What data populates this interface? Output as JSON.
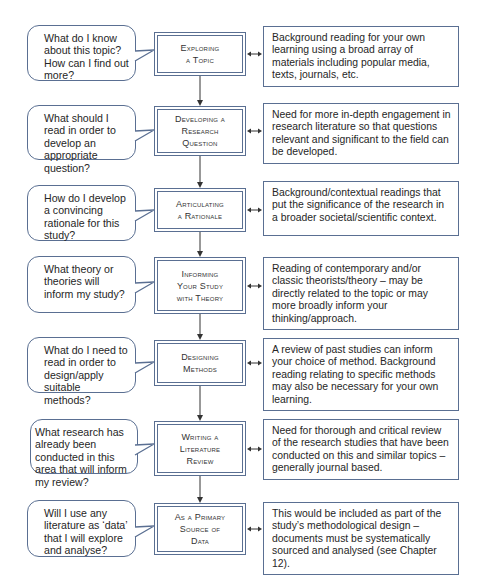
{
  "diagram": {
    "type": "flowchart",
    "colors": {
      "border": "#5a6f92",
      "text": "#262626",
      "arrow": "#333333"
    },
    "steps": [
      {
        "question": "What do I know about this topic? How can I find out more?",
        "stage_line1": "Exploring",
        "stage_line2": "a Topic",
        "stage_line3": "",
        "description": "Background reading for your own learning using a broad array of materials including popular media, texts, journals, etc."
      },
      {
        "question": "What should I read in order to develop an appropriate question?",
        "stage_line1": "Developing a",
        "stage_line2": "Research",
        "stage_line3": "Question",
        "description": "Need for more in-depth engagement in research literature so that questions relevant and significant to the field can be developed."
      },
      {
        "question": "How do I develop a convincing rationale for this study?",
        "stage_line1": "Articulating",
        "stage_line2": "a Rationale",
        "stage_line3": "",
        "description": "Background/contextual readings that put the significance of the research in a broader societal/scientific context."
      },
      {
        "question": "What theory or theories will inform my study?",
        "stage_line1": "Informing",
        "stage_line2": "Your Study",
        "stage_line3": "with Theory",
        "description": "Reading of contemporary and/or classic theorists/theory – may be directly related to the topic or may more broadly inform your thinking/approach."
      },
      {
        "question": "What do I need to read in order to design/apply suitable methods?",
        "stage_line1": "Designing",
        "stage_line2": "Methods",
        "stage_line3": "",
        "description": "A review of past studies can inform your choice of method. Background reading relating to specific methods may also be necessary for your own learning."
      },
      {
        "question": "What research has already been conducted in this area that will inform my review?",
        "stage_line1": "Writing a",
        "stage_line2": "Literature",
        "stage_line3": "Review",
        "description": "Need for thorough and critical review of the research studies that have been conducted on this and similar topics – generally journal based."
      },
      {
        "question": "Will I use any literature as ‘data’ that I will explore and analyse?",
        "stage_line1": "As a Primary",
        "stage_line2": "Source of",
        "stage_line3": "Data",
        "description": "This would be included as part of the study’s methodological design – documents must be systematically sourced and analysed (see Chapter 12)."
      }
    ]
  }
}
